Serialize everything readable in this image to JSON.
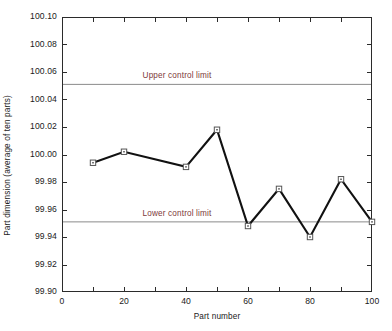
{
  "chart_data": {
    "type": "line",
    "title": "",
    "xlabel": "Part number",
    "ylabel": "Part dimension (average of ten parts)",
    "x": [
      10,
      20,
      40,
      50,
      60,
      70,
      80,
      90,
      100
    ],
    "values": [
      99.994,
      100.002,
      99.991,
      100.018,
      99.948,
      99.975,
      99.94,
      99.982,
      99.951
    ],
    "series": [
      {
        "name": "Part dimension",
        "values": [
          99.994,
          100.002,
          99.991,
          100.018,
          99.948,
          99.975,
          99.94,
          99.982,
          99.951
        ]
      }
    ],
    "xlim": [
      0,
      100
    ],
    "ylim": [
      99.9,
      100.1
    ],
    "ytick_labels": [
      "100.10",
      "100.08",
      "100.06",
      "100.04",
      "100.02",
      "100.00",
      "99.98",
      "99.96",
      "99.94",
      "99.92",
      "99.90"
    ],
    "ytick_values": [
      100.1,
      100.08,
      100.06,
      100.04,
      100.02,
      100.0,
      99.98,
      99.96,
      99.94,
      99.92,
      99.9
    ],
    "xtick_labels": [
      "0",
      "20",
      "40",
      "60",
      "80",
      "100"
    ],
    "xtick_values": [
      0,
      20,
      40,
      60,
      80,
      100
    ],
    "xtick_minor_values": [
      10,
      30,
      50,
      70,
      90
    ],
    "grid": false,
    "legend_position": "none",
    "marker": "open-square",
    "line_color": "#111111",
    "marker_face_color": "#ffffff",
    "marker_edge_color": "#555555",
    "annotations": [
      {
        "name": "upper-control-limit",
        "label": "Upper control limit",
        "y": 100.051,
        "label_x": 26,
        "color": "#7d3a3a",
        "line_color": "#8a8a8a"
      },
      {
        "name": "lower-control-limit",
        "label": "Lower control limit",
        "y": 99.951,
        "label_x": 26,
        "color": "#7d3a3a",
        "line_color": "#8a8a8a"
      }
    ],
    "axes_color": "#2b2b2b",
    "background": "#ffffff"
  }
}
